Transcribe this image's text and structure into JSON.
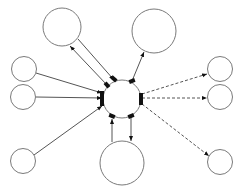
{
  "diagram": {
    "type": "hub-and-spoke network",
    "width": 243,
    "height": 193,
    "colors": {
      "node_stroke": "#7a7a7a",
      "edge": "#555555",
      "port": "#111111",
      "background": "#ffffff"
    },
    "nodes": [
      {
        "id": "hub",
        "cx": 122,
        "cy": 99,
        "r": 19
      },
      {
        "id": "top-left",
        "cx": 62,
        "cy": 27,
        "r": 19
      },
      {
        "id": "top-right",
        "cx": 154,
        "cy": 31,
        "r": 22
      },
      {
        "id": "left-1",
        "cx": 24,
        "cy": 69,
        "r": 12.5
      },
      {
        "id": "left-2",
        "cx": 23,
        "cy": 97,
        "r": 12.5
      },
      {
        "id": "left-3",
        "cx": 23,
        "cy": 161,
        "r": 12.5
      },
      {
        "id": "bottom",
        "cx": 122,
        "cy": 163,
        "r": 22
      },
      {
        "id": "right-1",
        "cx": 220,
        "cy": 69,
        "r": 12.5
      },
      {
        "id": "right-2",
        "cx": 220,
        "cy": 97,
        "r": 12.5
      },
      {
        "id": "right-3",
        "cx": 220,
        "cy": 162,
        "r": 12.5
      }
    ],
    "edges": [
      {
        "from": "hub",
        "to": "top-left",
        "style": "solid",
        "x1": 107,
        "y1": 85,
        "x2": 70,
        "y2": 46
      },
      {
        "from": "top-left",
        "to": "hub",
        "style": "solid",
        "x1": 78,
        "y1": 39,
        "x2": 114,
        "y2": 80
      },
      {
        "from": "hub",
        "to": "top-right",
        "style": "solid",
        "x1": 132,
        "y1": 81,
        "x2": 144,
        "y2": 52
      },
      {
        "from": "left-1",
        "to": "hub",
        "style": "solid",
        "x1": 36,
        "y1": 73,
        "x2": 102,
        "y2": 93
      },
      {
        "from": "left-2",
        "to": "hub",
        "style": "solid",
        "x1": 36,
        "y1": 97,
        "x2": 102,
        "y2": 98
      },
      {
        "from": "left-3",
        "to": "hub",
        "style": "solid",
        "x1": 34,
        "y1": 155,
        "x2": 102,
        "y2": 106
      },
      {
        "from": "bottom",
        "to": "hub",
        "style": "solid",
        "x1": 112,
        "y1": 142,
        "x2": 112,
        "y2": 119
      },
      {
        "from": "hub",
        "to": "bottom",
        "style": "solid",
        "x1": 131,
        "y1": 117,
        "x2": 131,
        "y2": 141
      },
      {
        "from": "hub",
        "to": "right-1",
        "style": "dashed",
        "x1": 142,
        "y1": 94,
        "x2": 207,
        "y2": 74
      },
      {
        "from": "hub",
        "to": "right-2",
        "style": "dashed",
        "x1": 142,
        "y1": 98,
        "x2": 207,
        "y2": 98
      },
      {
        "from": "hub",
        "to": "right-3",
        "style": "dashed",
        "x1": 142,
        "y1": 104,
        "x2": 209,
        "y2": 156
      }
    ],
    "ports": [
      {
        "x": 100,
        "y": 91,
        "w": 4,
        "h": 15
      },
      {
        "x": 139,
        "y": 93,
        "w": 4,
        "h": 12
      },
      {
        "x": 111,
        "y": 77,
        "w": 6,
        "h": 4,
        "rot": 40
      },
      {
        "x": 104,
        "y": 83,
        "w": 6,
        "h": 4,
        "rot": 50
      },
      {
        "x": 129,
        "y": 79,
        "w": 6,
        "h": 4,
        "rot": -20
      },
      {
        "x": 109,
        "y": 114,
        "w": 6,
        "h": 4,
        "rot": 20
      },
      {
        "x": 128,
        "y": 114,
        "w": 6,
        "h": 4,
        "rot": -20
      }
    ]
  }
}
